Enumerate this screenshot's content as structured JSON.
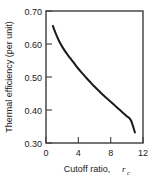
{
  "chart_data": {
    "type": "line",
    "title": "",
    "subtitle": "",
    "xlabel_text": "Cutoff ratio,",
    "xlabel_symbol": "r",
    "xlabel_symbol_sub": "c",
    "xlabel": "Cutoff ratio, r_c",
    "ylabel": "Thermal efficiency (per unit)",
    "xlim": [
      0,
      12
    ],
    "ylim": [
      0.3,
      0.7
    ],
    "xticks": [
      0,
      4,
      8,
      12
    ],
    "xtick_labels": [
      "0",
      "4",
      "8",
      "12"
    ],
    "yticks": [
      0.3,
      0.4,
      0.5,
      0.6,
      0.7
    ],
    "ytick_labels": [
      "0.30",
      "0.40",
      "0.50",
      "0.60",
      "0.70"
    ],
    "grid": false,
    "legend": false,
    "legend_position": "none",
    "line_color": "#1a1a1a",
    "line_width": 2.0,
    "frame_color": "#3c3c3c",
    "background_color": "#ffffff",
    "series": [
      {
        "name": "Thermal efficiency",
        "x": [
          0.85,
          1.2,
          1.6,
          2.0,
          2.5,
          3.0,
          3.5,
          4.0,
          4.5,
          5.0,
          5.5,
          6.0,
          6.5,
          7.0,
          7.5,
          8.0,
          8.5,
          9.0,
          9.5,
          10.0,
          10.5,
          11.0
        ],
        "values": [
          0.655,
          0.632,
          0.61,
          0.592,
          0.573,
          0.557,
          0.541,
          0.525,
          0.511,
          0.497,
          0.484,
          0.471,
          0.459,
          0.447,
          0.436,
          0.425,
          0.414,
          0.403,
          0.392,
          0.381,
          0.369,
          0.332
        ]
      }
    ]
  },
  "figure": {
    "caption": ""
  }
}
